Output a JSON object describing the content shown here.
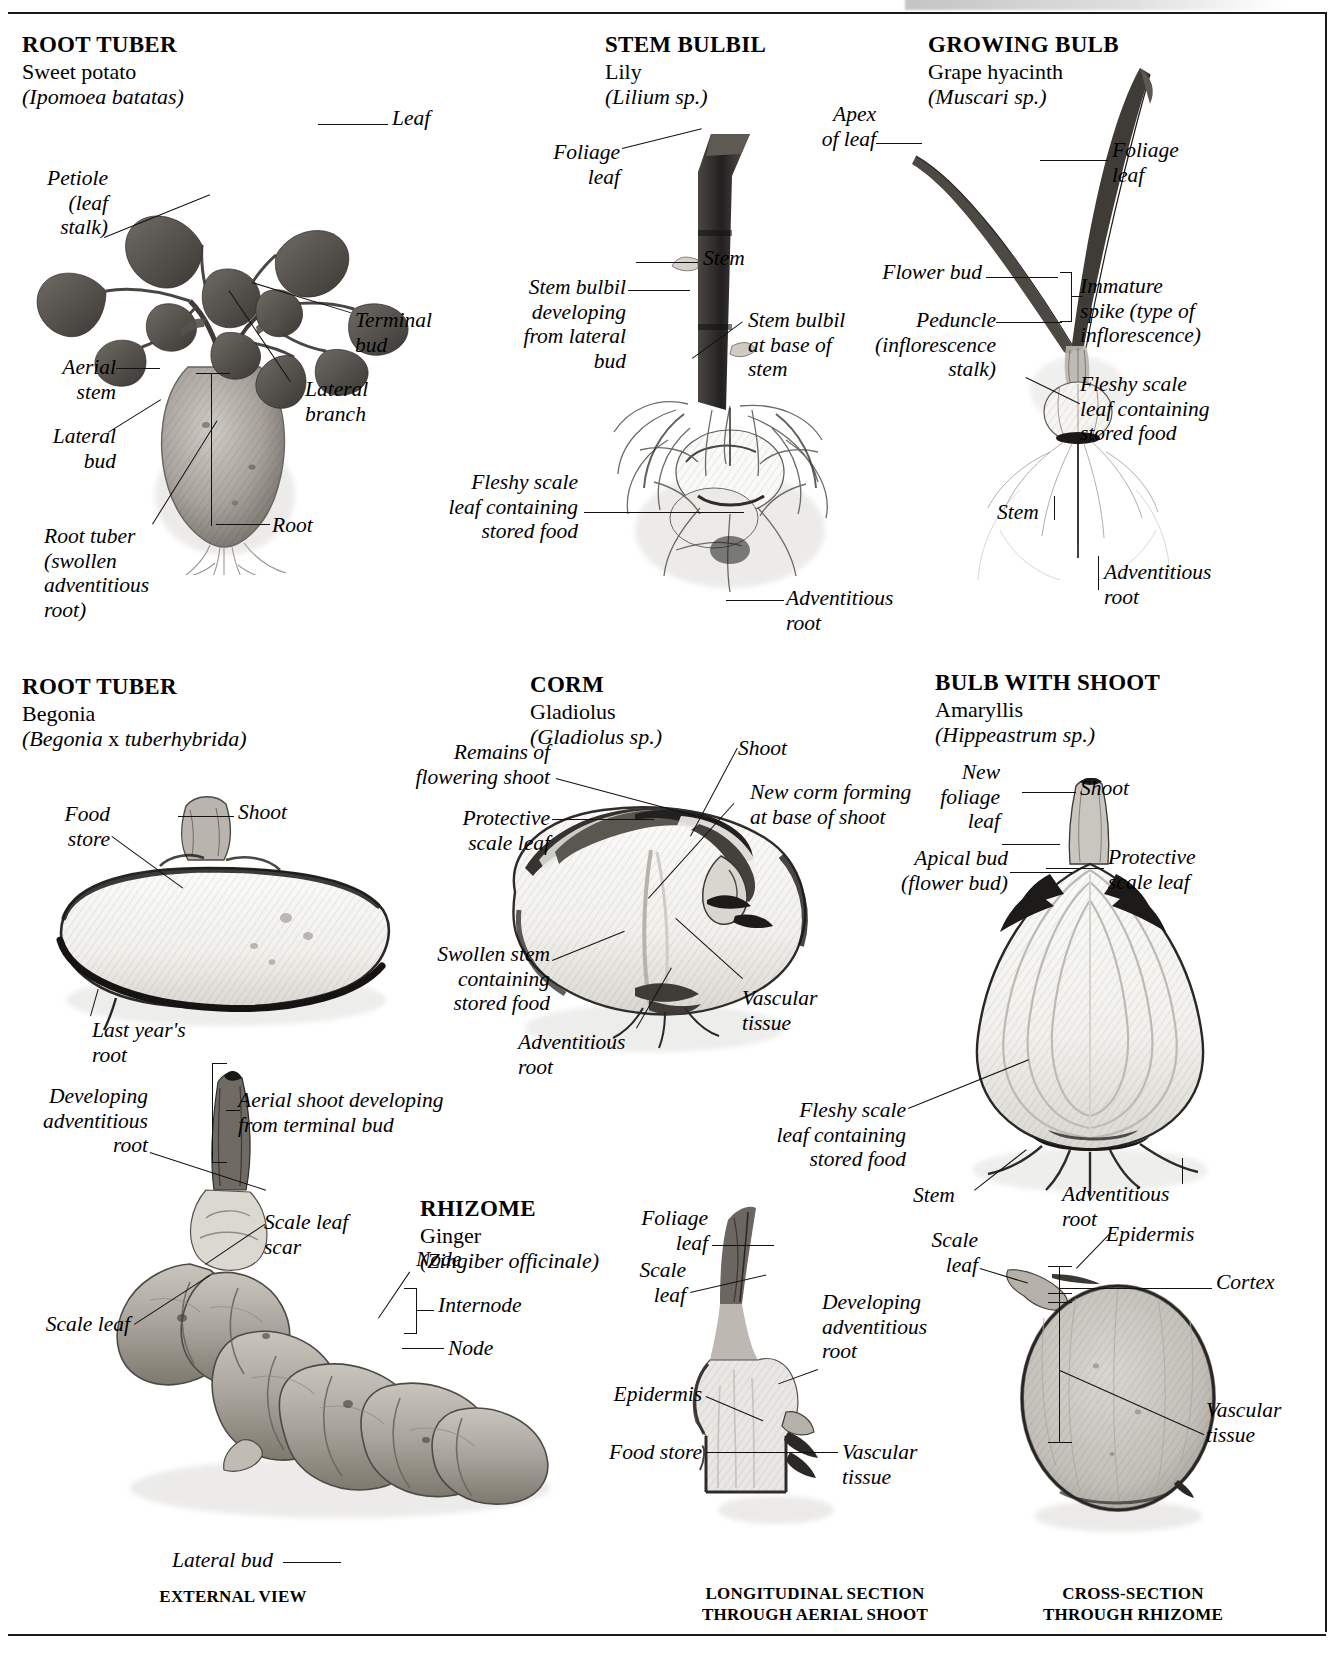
{
  "page": {
    "ink": "#111111"
  },
  "panels": [
    {
      "id": "sweet-potato",
      "heading": {
        "type": "ROOT TUBER",
        "common": "Sweet potato",
        "latin": "(Ipomoea batatas)"
      },
      "labels": [
        "Leaf",
        "Petiole\n(leaf\nstalk)",
        "Terminal\nbud",
        "Lateral\nbranch",
        "Aerial\nstem",
        "Lateral\nbud",
        "Root tuber\n(swollen\nadventitious\nroot)",
        "Root"
      ]
    },
    {
      "id": "lily-bulbil",
      "heading": {
        "type": "STEM BULBIL",
        "common": "Lily",
        "latin": "(Lilium sp.)"
      },
      "labels": [
        "Foliage\nleaf",
        "Stem",
        "Stem bulbil\ndeveloping\nfrom lateral\nbud",
        "Stem bulbil\nat base of\nstem",
        "Fleshy scale\nleaf containing\nstored food",
        "Adventitious\nroot"
      ]
    },
    {
      "id": "grape-hyacinth",
      "heading": {
        "type": "GROWING BULB",
        "common": "Grape hyacinth",
        "latin": "(Muscari sp.)"
      },
      "labels": [
        "Apex\nof leaf",
        "Foliage\nleaf",
        "Flower bud",
        "Immature\nspike (type of\ninflorescence)",
        "Peduncle\n(inflorescence\nstalk)",
        "Fleshy scale\nleaf containing\nstored food",
        "Stem",
        "Adventitious\nroot"
      ]
    },
    {
      "id": "begonia",
      "heading": {
        "type": "ROOT TUBER",
        "common": "Begonia",
        "latin": "(Begonia x tuberhybrida)",
        "latin_roman_word": "x"
      },
      "labels": [
        "Food\nstore",
        "Shoot",
        "Last year's\nroot"
      ]
    },
    {
      "id": "gladiolus-corm",
      "heading": {
        "type": "CORM",
        "common": "Gladiolus",
        "latin": "(Gladiolus sp.)"
      },
      "labels": [
        "Remains of\nflowering shoot",
        "Shoot",
        "New corm forming\nat base of shoot",
        "Protective\nscale leaf",
        "Swollen stem\ncontaining\nstored food",
        "Adventitious\nroot",
        "Vascular\ntissue"
      ]
    },
    {
      "id": "amaryllis",
      "heading": {
        "type": "BULB WITH SHOOT",
        "common": "Amaryllis",
        "latin": "(Hippeastrum sp.)"
      },
      "labels": [
        "New\nfoliage\nleaf",
        "Shoot",
        "Apical bud\n(flower bud)",
        "Protective\nscale leaf",
        "Fleshy scale\nleaf containing\nstored food",
        "Stem",
        "Adventitious\nroot"
      ]
    },
    {
      "id": "ginger-rhizome",
      "heading": {
        "type": "RHIZOME",
        "common": "Ginger",
        "latin": "(Zingiber officinale)"
      },
      "labels": [
        "Developing\nadventitious\nroot",
        "Aerial shoot developing\nfrom terminal bud",
        "Scale leaf\nscar",
        "Node",
        "Internode",
        "Node",
        "Scale leaf",
        "Lateral bud",
        "Foliage\nleaf",
        "Scale\nleaf",
        "Developing\nadventitious\nroot",
        "Epidermis",
        "Food store",
        "Vascular\ntissue",
        "Scale\nleaf",
        "Epidermis",
        "Cortex",
        "Vascular\ntissue"
      ],
      "captions": [
        "EXTERNAL VIEW",
        "LONGITUDINAL SECTION\nTHROUGH AERIAL SHOOT",
        "CROSS-SECTION\nTHROUGH RHIZOME"
      ]
    }
  ],
  "sweet_potato": {
    "head_type": "ROOT TUBER",
    "head_common": "Sweet potato",
    "head_latin": "(Ipomoea batatas)",
    "l_leaf": "Leaf",
    "l_petiole": "Petiole\n(leaf\nstalk)",
    "l_terminal_bud": "Terminal\nbud",
    "l_lateral_branch": "Lateral\nbranch",
    "l_aerial_stem": "Aerial\nstem",
    "l_lateral_bud": "Lateral\nbud",
    "l_root_tuber": "Root tuber\n(swollen\nadventitious\nroot)",
    "l_root": "Root"
  },
  "lily": {
    "head_type": "STEM BULBIL",
    "head_common": "Lily",
    "head_latin": "(Lilium sp.)",
    "l_foliage_leaf": "Foliage\nleaf",
    "l_stem": "Stem",
    "l_bulbil_lateral": "Stem bulbil\ndeveloping\nfrom lateral\nbud",
    "l_bulbil_base": "Stem bulbil\nat base of\nstem",
    "l_fleshy_scale": "Fleshy scale\nleaf containing\nstored food",
    "l_adv_root": "Adventitious\nroot"
  },
  "hyacinth": {
    "head_type": "GROWING BULB",
    "head_common": "Grape hyacinth",
    "head_latin": "(Muscari sp.)",
    "l_apex": "Apex\nof leaf",
    "l_foliage_leaf": "Foliage\nleaf",
    "l_flower_bud": "Flower bud",
    "l_immature_spike": "Immature\nspike (type of\ninflorescence)",
    "l_peduncle": "Peduncle\n(inflorescence\nstalk)",
    "l_fleshy_scale": "Fleshy scale\nleaf containing\nstored food",
    "l_stem": "Stem",
    "l_adv_root": "Adventitious\nroot"
  },
  "begonia": {
    "head_type": "ROOT TUBER",
    "head_common": "Begonia",
    "head_latin_a": "(Begonia",
    "head_latin_x": " x ",
    "head_latin_b": "tuberhybrida)",
    "l_food_store": "Food\nstore",
    "l_shoot": "Shoot",
    "l_last_year_root": "Last year's\nroot"
  },
  "corm": {
    "head_type": "CORM",
    "head_common": "Gladiolus",
    "head_latin": "(Gladiolus sp.)",
    "l_remains": "Remains of\nflowering shoot",
    "l_shoot": "Shoot",
    "l_new_corm": "New corm forming\nat base of shoot",
    "l_protective": "Protective\nscale leaf",
    "l_swollen_stem": "Swollen stem\ncontaining\nstored food",
    "l_adv_root": "Adventitious\nroot",
    "l_vascular": "Vascular\ntissue"
  },
  "amaryllis": {
    "head_type": "BULB WITH SHOOT",
    "head_common": "Amaryllis",
    "head_latin": "(Hippeastrum sp.)",
    "l_new_foliage": "New\nfoliage\nleaf",
    "l_shoot": "Shoot",
    "l_apical_bud": "Apical bud\n(flower bud)",
    "l_protective": "Protective\nscale leaf",
    "l_fleshy_scale": "Fleshy scale\nleaf containing\nstored food",
    "l_stem": "Stem",
    "l_adv_root": "Adventitious\nroot"
  },
  "ginger": {
    "head_type": "RHIZOME",
    "head_common": "Ginger",
    "head_latin": "(Zingiber officinale)",
    "l_dev_adv_root": "Developing\nadventitious\nroot",
    "l_aerial_shoot": "Aerial shoot developing\nfrom terminal bud",
    "l_scale_leaf_scar": "Scale leaf\nscar",
    "l_node_1": "Node",
    "l_internode": "Internode",
    "l_node_2": "Node",
    "l_scale_leaf": "Scale leaf",
    "l_lateral_bud": "Lateral bud",
    "cap_external": "EXTERNAL VIEW"
  },
  "ls": {
    "l_foliage_leaf": "Foliage\nleaf",
    "l_scale_leaf": "Scale\nleaf",
    "l_dev_adv_root": "Developing\nadventitious\nroot",
    "l_epidermis": "Epidermis",
    "l_food_store": "Food store",
    "l_vascular": "Vascular\ntissue",
    "cap": "LONGITUDINAL SECTION\nTHROUGH AERIAL SHOOT"
  },
  "xs": {
    "l_scale_leaf": "Scale\nleaf",
    "l_epidermis": "Epidermis",
    "l_cortex": "Cortex",
    "l_vascular": "Vascular\ntissue",
    "cap": "CROSS-SECTION\nTHROUGH RHIZOME"
  }
}
